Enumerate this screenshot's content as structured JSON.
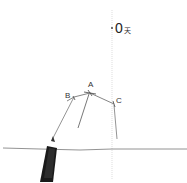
{
  "sketch": {
    "top_label_number": "0",
    "top_label_char": "天",
    "points": {
      "a": "A",
      "b": "B",
      "c": "C"
    },
    "colors": {
      "background": "#ffffff",
      "line": "#555555",
      "pen": "#1a1a1a"
    }
  }
}
